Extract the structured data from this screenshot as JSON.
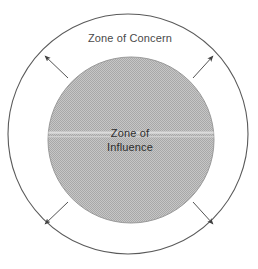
{
  "diagram": {
    "type": "concentric-circle-diagram",
    "background_color": "#ffffff",
    "outer_zone": {
      "label": "Zone of Concern",
      "shape": "circle",
      "fill_color": "#ffffff",
      "stroke_color": "#5a5a5a",
      "center_x": 128,
      "center_y": 134,
      "radius": 120,
      "label_x": 130,
      "label_y": 42
    },
    "inner_zone": {
      "label_line1": "Zone of",
      "label_line2": "Influence",
      "shape": "circle",
      "fill_color": "#b9b9b9",
      "stroke_color": "#9a9a9a",
      "center_x": 131,
      "center_y": 140,
      "radius": 83,
      "label_x": 130,
      "label_y": 137,
      "label_line_height": 14
    },
    "arrows": {
      "count": 4,
      "direction": "outward",
      "stroke_color": "#4a4a4a",
      "description": "arrows pointing outward from Zone of Influence toward Zone of Concern",
      "items": [
        {
          "name": "arrow-top-left",
          "x1": 68,
          "y1": 78,
          "x2": 45,
          "y2": 56
        },
        {
          "name": "arrow-top-right",
          "x1": 193,
          "y1": 78,
          "x2": 213,
          "y2": 56
        },
        {
          "name": "arrow-bottom-left",
          "x1": 68,
          "y1": 202,
          "x2": 45,
          "y2": 224
        },
        {
          "name": "arrow-bottom-right",
          "x1": 193,
          "y1": 202,
          "x2": 213,
          "y2": 224
        }
      ]
    }
  }
}
